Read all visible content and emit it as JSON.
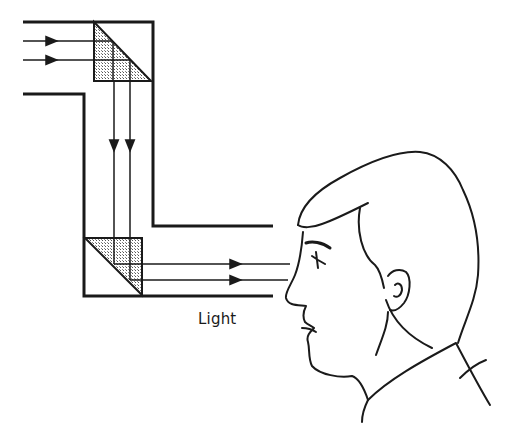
{
  "diagram": {
    "colors": {
      "ink": "#1a1a1a",
      "background": "#ffffff",
      "prism_fill": "#bdbdbd"
    },
    "labels": {
      "light": "Light"
    },
    "components": [
      {
        "name": "upper-prism",
        "type": "right-angle prism"
      },
      {
        "name": "lower-prism",
        "type": "right-angle prism"
      },
      {
        "name": "periscope-tube",
        "type": "Z-shaped tube"
      },
      {
        "name": "observer-head",
        "type": "side profile"
      }
    ],
    "rays": {
      "count": 2,
      "direction": "left-to-right, down, then right to eye"
    }
  }
}
